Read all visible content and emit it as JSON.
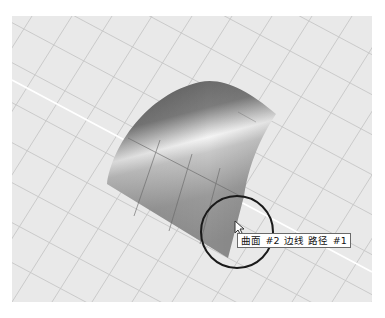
{
  "viewport": {
    "name": "Perspective",
    "background": "#e9e9e9",
    "grid_color": "#c4c4c4",
    "axis_color": "#ffffff"
  },
  "scene": {
    "object": "曲面 #2",
    "highlight_circle_color": "#1a1a1a"
  },
  "tooltip": {
    "surface": "曲面",
    "surface_id": "#2",
    "edge": "边线",
    "path": "路径",
    "path_id": "#1"
  },
  "cursor": {
    "icon": "arrow-pointer-icon"
  }
}
